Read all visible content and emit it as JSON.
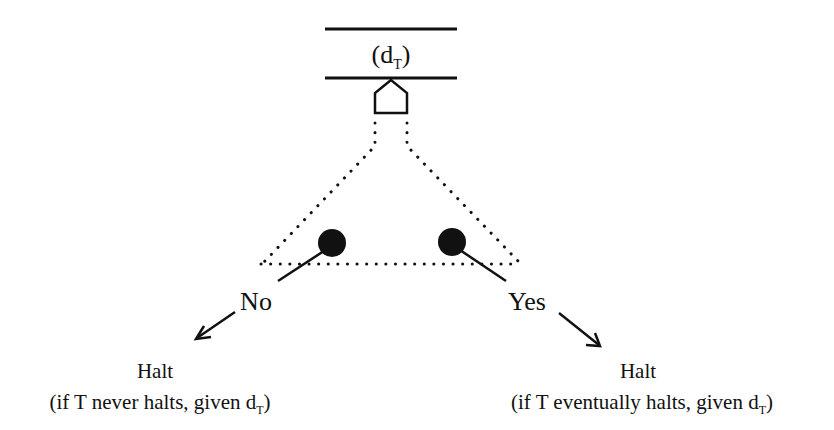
{
  "tape": {
    "cell_label": "d",
    "cell_subscript": "T",
    "cell_open": "(",
    "cell_close": ")"
  },
  "branches": {
    "no": {
      "label": "No",
      "result": "Halt",
      "caption_prefix": "(if T never halts, given d",
      "caption_subscript": "T",
      "caption_suffix": ")"
    },
    "yes": {
      "label": "Yes",
      "result": "Halt",
      "caption_prefix": "(if T eventually halts, given d",
      "caption_subscript": "T",
      "caption_suffix": ")"
    }
  },
  "colors": {
    "ink": "#111111",
    "background": "#ffffff"
  }
}
